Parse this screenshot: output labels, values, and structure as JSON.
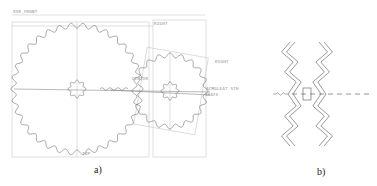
{
  "figure_a": {
    "caption": "a)",
    "labels": {
      "front": "XSR_FRONT",
      "right_top": "RIGHT",
      "right_gear": "RIGHT",
      "center": "CENTER",
      "axis": "ACMGLEAT STH",
      "axis_sub": "SHAFE",
      "bottom": "TOP"
    },
    "large_gear": {
      "cx": 77,
      "cy": 89,
      "r_outer": 66,
      "r_root": 61,
      "teeth": 34
    },
    "large_hub": {
      "cx": 77,
      "cy": 89,
      "r_outer": 9,
      "r_root": 6.5,
      "teeth": 8
    },
    "small_gear": {
      "cx": 170,
      "cy": 91,
      "r_outer": 38,
      "r_root": 33.5,
      "teeth": 20
    },
    "small_hub": {
      "cx": 170,
      "cy": 91,
      "r_outer": 9,
      "r_root": 6.5,
      "teeth": 8
    }
  },
  "figure_b": {
    "caption": "b)"
  },
  "colors": {
    "line": "#7a7a7a",
    "frame": "#c4c4c4",
    "gear": "#6e6e6e"
  }
}
